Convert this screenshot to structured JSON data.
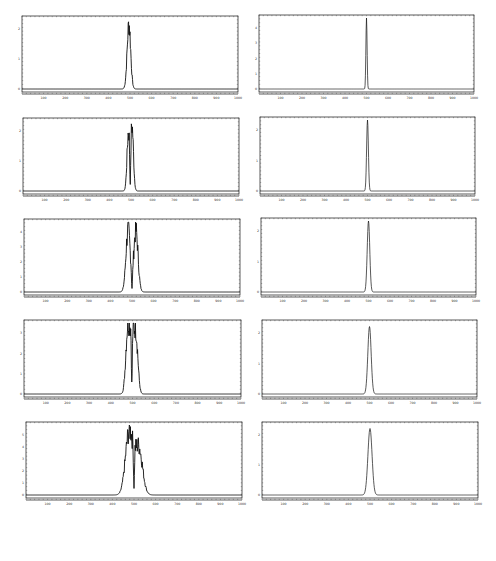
{
  "layout": {
    "rows": 5,
    "cols": 2
  },
  "chart_data": [
    {
      "type": "line",
      "panel": "left-1",
      "title": "",
      "xlabel": "",
      "ylabel": "",
      "xlim": [
        0,
        1000
      ],
      "x_ticks": [
        100,
        200,
        300,
        400,
        500,
        600,
        700,
        800,
        900,
        1000
      ],
      "y_ticks_approx": [
        0,
        1,
        2
      ],
      "grid": false,
      "series": [
        {
          "name": "intensity",
          "shape": "single noisy peak",
          "peak_positions": [
            495
          ],
          "peak_heights_rel": [
            1.0
          ],
          "width": 18,
          "noisy": true
        }
      ]
    },
    {
      "type": "line",
      "panel": "right-1",
      "title": "",
      "xlabel": "",
      "ylabel": "",
      "xlim": [
        0,
        1000
      ],
      "x_ticks": [
        100,
        200,
        300,
        400,
        500,
        600,
        700,
        800,
        900,
        1000
      ],
      "y_ticks_approx": [
        0,
        1,
        2,
        3,
        4
      ],
      "grid": false,
      "series": [
        {
          "name": "intensity",
          "shape": "single sharp peak",
          "peak_positions": [
            500
          ],
          "peak_heights_rel": [
            1.0
          ],
          "width": 6,
          "noisy": false
        }
      ]
    },
    {
      "type": "line",
      "panel": "left-2",
      "title": "",
      "xlabel": "",
      "ylabel": "",
      "xlim": [
        0,
        1000
      ],
      "x_ticks": [
        100,
        200,
        300,
        400,
        500,
        600,
        700,
        800,
        900,
        1000
      ],
      "y_ticks_approx": [
        0,
        1,
        2
      ],
      "grid": false,
      "series": [
        {
          "name": "intensity",
          "shape": "split peak",
          "peak_positions": [
            488,
            505
          ],
          "peak_heights_rel": [
            0.88,
            0.97
          ],
          "width": 26,
          "noisy": true
        }
      ]
    },
    {
      "type": "line",
      "panel": "right-2",
      "title": "",
      "xlabel": "",
      "ylabel": "",
      "xlim": [
        0,
        1000
      ],
      "x_ticks": [
        100,
        200,
        300,
        400,
        500,
        600,
        700,
        800,
        900,
        1000
      ],
      "y_ticks_approx": [
        0,
        1,
        2
      ],
      "grid": false,
      "series": [
        {
          "name": "intensity",
          "shape": "single sharp peak",
          "peak_positions": [
            500
          ],
          "peak_heights_rel": [
            1.0
          ],
          "width": 9,
          "noisy": false
        }
      ]
    },
    {
      "type": "line",
      "panel": "left-3",
      "title": "",
      "xlabel": "",
      "ylabel": "",
      "xlim": [
        0,
        1000
      ],
      "x_ticks": [
        100,
        200,
        300,
        400,
        500,
        600,
        700,
        800,
        900,
        1000
      ],
      "y_ticks_approx": [
        0,
        1,
        2,
        3,
        4
      ],
      "grid": false,
      "series": [
        {
          "name": "intensity",
          "shape": "double peak",
          "peak_positions": [
            482,
            518
          ],
          "peak_heights_rel": [
            0.96,
            0.95
          ],
          "width": 40,
          "noisy": true
        }
      ]
    },
    {
      "type": "line",
      "panel": "right-3",
      "title": "",
      "xlabel": "",
      "ylabel": "",
      "xlim": [
        0,
        1000
      ],
      "x_ticks": [
        100,
        200,
        300,
        400,
        500,
        600,
        700,
        800,
        900,
        1000
      ],
      "y_ticks_approx": [
        0,
        1,
        2
      ],
      "grid": false,
      "series": [
        {
          "name": "intensity",
          "shape": "single peak",
          "peak_positions": [
            500
          ],
          "peak_heights_rel": [
            1.0
          ],
          "width": 13,
          "noisy": false
        }
      ]
    },
    {
      "type": "line",
      "panel": "left-4",
      "title": "",
      "xlabel": "",
      "ylabel": "",
      "xlim": [
        0,
        1000
      ],
      "x_ticks": [
        100,
        200,
        300,
        400,
        500,
        600,
        700,
        800,
        900,
        1000
      ],
      "y_ticks_approx": [
        0,
        1,
        2,
        3
      ],
      "grid": false,
      "series": [
        {
          "name": "intensity",
          "shape": "triple-lobed peak",
          "peak_positions": [
            478,
            497,
            516
          ],
          "peak_heights_rel": [
            0.97,
            0.82,
            0.88
          ],
          "width": 55,
          "noisy": true
        }
      ]
    },
    {
      "type": "line",
      "panel": "right-4",
      "title": "",
      "xlabel": "",
      "ylabel": "",
      "xlim": [
        0,
        1000
      ],
      "x_ticks": [
        100,
        200,
        300,
        400,
        500,
        600,
        700,
        800,
        900,
        1000
      ],
      "y_ticks_approx": [
        0,
        1,
        2
      ],
      "grid": false,
      "series": [
        {
          "name": "intensity",
          "shape": "single peak",
          "peak_positions": [
            500
          ],
          "peak_heights_rel": [
            0.95
          ],
          "width": 17,
          "noisy": false
        }
      ]
    },
    {
      "type": "line",
      "panel": "left-5",
      "title": "",
      "xlabel": "",
      "ylabel": "",
      "xlim": [
        0,
        1000
      ],
      "x_ticks": [
        100,
        200,
        300,
        400,
        500,
        600,
        700,
        800,
        900,
        1000
      ],
      "y_ticks_approx": [
        0,
        1,
        2,
        3,
        4,
        5
      ],
      "grid": false,
      "series": [
        {
          "name": "intensity",
          "shape": "double peak with dip at center",
          "peak_positions": [
            478,
            522
          ],
          "peak_heights_rel": [
            0.97,
            0.72
          ],
          "width": 70,
          "noisy": true
        }
      ]
    },
    {
      "type": "line",
      "panel": "right-5",
      "title": "",
      "xlabel": "",
      "ylabel": "",
      "xlim": [
        0,
        1000
      ],
      "x_ticks": [
        100,
        200,
        300,
        400,
        500,
        600,
        700,
        800,
        900,
        1000
      ],
      "y_ticks_approx": [
        0,
        1,
        2
      ],
      "grid": false,
      "series": [
        {
          "name": "intensity",
          "shape": "single peak",
          "peak_positions": [
            500
          ],
          "peak_heights_rel": [
            0.95
          ],
          "width": 21,
          "noisy": false
        }
      ]
    }
  ],
  "panels": [
    {
      "id": "left-1",
      "x": 22,
      "y": 16,
      "w": 216,
      "h": 80,
      "ylabels": [
        "0",
        "1",
        "2"
      ]
    },
    {
      "id": "right-1",
      "x": 259,
      "y": 15,
      "w": 215,
      "h": 81,
      "ylabels": [
        "0",
        "1",
        "2",
        "3",
        "4"
      ]
    },
    {
      "id": "left-2",
      "x": 23,
      "y": 118,
      "w": 216,
      "h": 80,
      "ylabels": [
        "0",
        "1",
        "2"
      ]
    },
    {
      "id": "right-2",
      "x": 260,
      "y": 117,
      "w": 215,
      "h": 81,
      "ylabels": [
        "0",
        "1",
        "2"
      ]
    },
    {
      "id": "left-3",
      "x": 24,
      "y": 219,
      "w": 216,
      "h": 80,
      "ylabels": [
        "0",
        "1",
        "2",
        "3",
        "4"
      ]
    },
    {
      "id": "right-3",
      "x": 261,
      "y": 218,
      "w": 215,
      "h": 81,
      "ylabels": [
        "0",
        "1",
        "2"
      ]
    },
    {
      "id": "left-4",
      "x": 24,
      "y": 320,
      "w": 217,
      "h": 81,
      "ylabels": [
        "0",
        "1",
        "2",
        "3"
      ]
    },
    {
      "id": "right-4",
      "x": 262,
      "y": 320,
      "w": 215,
      "h": 81,
      "ylabels": [
        "0",
        "1",
        "2"
      ]
    },
    {
      "id": "left-5",
      "x": 26,
      "y": 422,
      "w": 216,
      "h": 80,
      "ylabels": [
        "0",
        "1",
        "2",
        "3",
        "4",
        "5"
      ]
    },
    {
      "id": "right-5",
      "x": 262,
      "y": 422,
      "w": 216,
      "h": 80,
      "ylabels": [
        "0",
        "1",
        "2"
      ]
    }
  ],
  "x_tick_labels": [
    "100",
    "200",
    "300",
    "400",
    "500",
    "600",
    "700",
    "800",
    "900",
    "1000"
  ],
  "colors": {
    "line": "#111111",
    "frame": "#333333",
    "background": "#ffffff"
  }
}
